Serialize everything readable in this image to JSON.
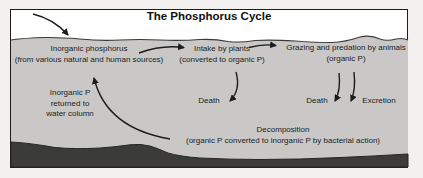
{
  "diagram": {
    "title": "The Phosphorus Cycle",
    "nodes": {
      "inorganic_phosphorus": {
        "line1": "Inorganic phosphorus",
        "line2": "(from various natural and human sources)"
      },
      "intake_by_plants": {
        "line1": "Intake by plants",
        "line2": "(converted to organic P)"
      },
      "grazing": {
        "line1": "Grazing and predation by animals",
        "line2": "(organic P)"
      },
      "inorganic_p_returned": {
        "line1": "Inorganic P",
        "line2": "returned to",
        "line3": "water column"
      },
      "death_plants": "Death",
      "death_animals": "Death",
      "excretion": "Excretion",
      "decomposition": {
        "line1": "Decomposition",
        "line2": "(organic P converted to inorganic P by bacterial action)"
      }
    },
    "colors": {
      "water": "#c9c8c6",
      "sediment": "#3b3b39",
      "ink": "#1c1c1c",
      "surface_background": "#ffffff",
      "page_background": "#f2f1ef"
    }
  }
}
